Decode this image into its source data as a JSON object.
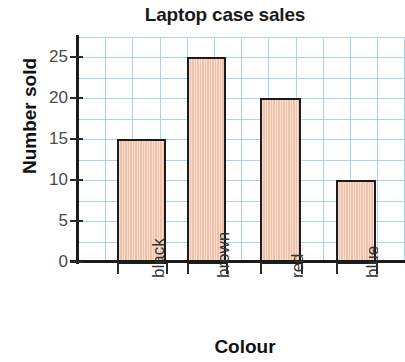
{
  "chart_data": {
    "type": "bar",
    "title": "Laptop case sales",
    "xlabel": "Colour",
    "ylabel": "Number sold",
    "categories": [
      "black",
      "brown",
      "red",
      "blue"
    ],
    "values": [
      15,
      25,
      20,
      10
    ],
    "ylim": [
      0,
      27.5
    ],
    "y_ticks": [
      0,
      5,
      10,
      15,
      20,
      25
    ],
    "y_tick_labels": [
      "0",
      "5",
      "10",
      "15",
      "20",
      "25"
    ],
    "grid": true,
    "grid_color": "#a9d3ee",
    "grid_minor_step": 2.5,
    "legend": null,
    "bar_fill_color": "#f0c3ab",
    "bar_edge_color": "#1b1b1b",
    "axis_color": "#1b1b1b",
    "background_color": "#ffffff",
    "x_tick_label_rotation": 90
  }
}
